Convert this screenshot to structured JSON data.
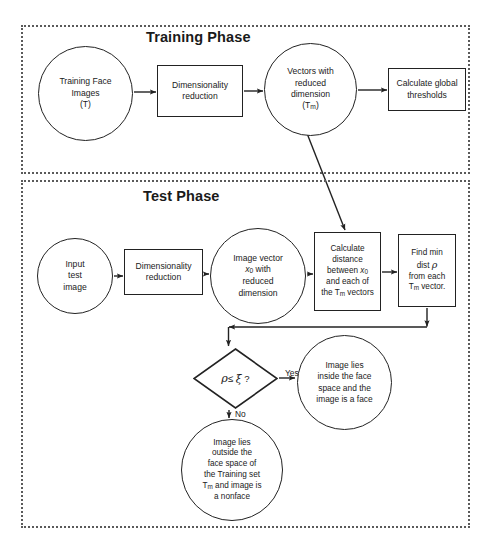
{
  "diagram": {
    "type": "flowchart",
    "background_color": "#ffffff",
    "stroke_color": "#222222",
    "phase_border_color": "#5a5a5a"
  },
  "phases": [
    {
      "id": "training",
      "title": "Training Phase"
    },
    {
      "id": "test",
      "title": "Test Phase"
    }
  ],
  "nodes": {
    "training_images": {
      "shape": "circle",
      "label": "Training Face\nImages\n(T)"
    },
    "train_dimred": {
      "shape": "rect",
      "label": "Dimensionality\nreduction"
    },
    "vectors_reduced": {
      "shape": "circle",
      "label_line1": "Vectors  with",
      "label_line2": "reduced",
      "label_line3": "dimension",
      "label_line4_pre": "(T",
      "label_line4_sub": "m",
      "label_line4_post": ")"
    },
    "global_thresholds": {
      "shape": "rect",
      "label": "Calculate global\nthresholds"
    },
    "input_test": {
      "shape": "circle",
      "label": "Input\ntest\nimage"
    },
    "test_dimred": {
      "shape": "rect",
      "label": "Dimensionality\nreduction"
    },
    "image_vector": {
      "shape": "circle",
      "line1": "Image vector",
      "line2_pre": "x",
      "line2_sub": "0",
      "line2_post": " with",
      "line3": "reduced",
      "line4": "dimension"
    },
    "calc_distance": {
      "shape": "rect",
      "line1": "Calculate",
      "line2": "distance",
      "line3_pre": "between ",
      "line3_var": "x",
      "line3_sub": "0",
      "line4": "and each of",
      "line5_pre": "the T",
      "line5_sub": "m",
      "line5_post": " vectors"
    },
    "find_min": {
      "shape": "rect",
      "line1": "Find min",
      "line2_pre": "dist ",
      "line2_rho": "ρ",
      "line3": "from each",
      "line4_pre": "T",
      "line4_sub": "m",
      "line4_post": " vector."
    },
    "decision": {
      "shape": "diamond",
      "rho": "ρ",
      "operator": "≤",
      "xi": "ξ",
      "question_mark": "?"
    },
    "inside_face": {
      "shape": "circle",
      "label": "Image lies\ninside the face\nspace and the\nimage is a face"
    },
    "nonface": {
      "shape": "circle",
      "line1": "Image lies",
      "line2": "outside the",
      "line3": "face space of",
      "line4": "the Training set",
      "line5_pre": "T",
      "line5_sub": "m",
      "line5_post": " and image is",
      "line6": "a nonface"
    }
  },
  "edge_labels": {
    "yes": "Yes",
    "no": "No"
  },
  "edges": [
    {
      "from": "training_images",
      "to": "train_dimred"
    },
    {
      "from": "train_dimred",
      "to": "vectors_reduced"
    },
    {
      "from": "vectors_reduced",
      "to": "global_thresholds"
    },
    {
      "from": "vectors_reduced",
      "to": "calc_distance"
    },
    {
      "from": "input_test",
      "to": "test_dimred"
    },
    {
      "from": "test_dimred",
      "to": "image_vector"
    },
    {
      "from": "image_vector",
      "to": "calc_distance"
    },
    {
      "from": "calc_distance",
      "to": "find_min"
    },
    {
      "from": "find_min",
      "to": "decision"
    },
    {
      "from": "decision",
      "to": "inside_face",
      "label": "Yes"
    },
    {
      "from": "decision",
      "to": "nonface",
      "label": "No"
    }
  ]
}
